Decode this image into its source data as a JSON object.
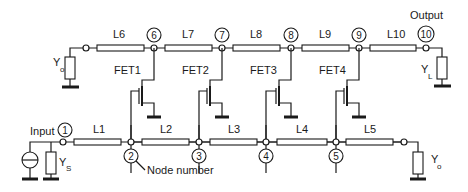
{
  "diagram": {
    "type": "distributed amplifier schematic",
    "labels": {
      "input": "Input",
      "output": "Output",
      "node_number": "Node number"
    },
    "gate_line": {
      "lines": [
        "L1",
        "L2",
        "L3",
        "L4",
        "L5"
      ],
      "nodes": [
        "1",
        "2",
        "3",
        "4",
        "5"
      ],
      "source_admittance": {
        "main": "Y",
        "sub": "S"
      },
      "termination": {
        "main": "Y",
        "sub": "o"
      }
    },
    "drain_line": {
      "lines": [
        "L6",
        "L7",
        "L8",
        "L9",
        "L10"
      ],
      "nodes": [
        "6",
        "7",
        "8",
        "9",
        "10"
      ],
      "termination": {
        "main": "Y",
        "sub": "o"
      },
      "load_admittance": {
        "main": "Y",
        "sub": "L"
      }
    },
    "transistors": [
      "FET1",
      "FET2",
      "FET3",
      "FET4"
    ],
    "colors": {
      "line": "#1a1a1a",
      "background": "#ffffff"
    }
  }
}
